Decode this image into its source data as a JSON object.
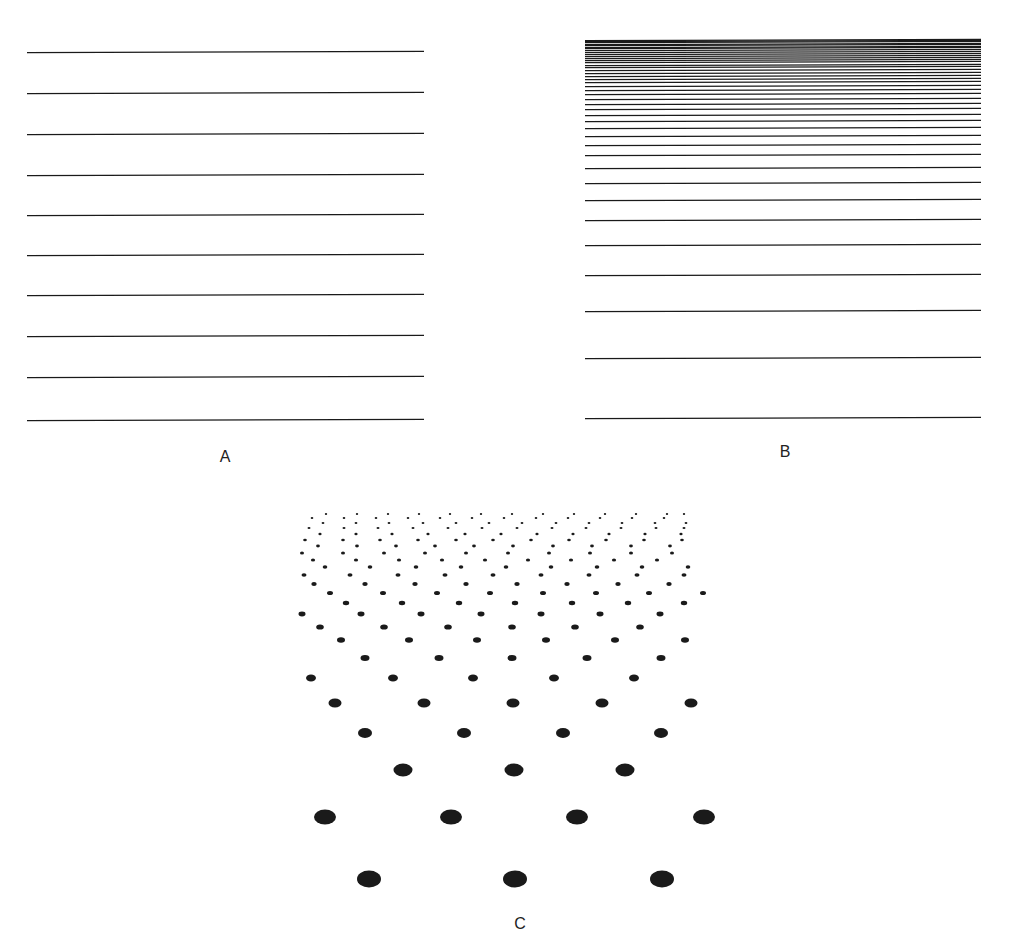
{
  "figure": {
    "background": "#ffffff",
    "ink_color": "#1a1a1a",
    "panels": [
      {
        "id": "A",
        "label": "A",
        "description": "Evenly spaced horizontal parallel lines",
        "line_count": 10,
        "x1": 27,
        "x2": 424,
        "y_lines": [
          52,
          93,
          134,
          175,
          215,
          255,
          295,
          336,
          377,
          420
        ],
        "label_pos": [
          225,
          458
        ]
      },
      {
        "id": "B",
        "label": "B",
        "description": "Horizontal lines with spacing that diminishes toward the top (texture gradient in perspective)",
        "x1": 585,
        "x2": 981,
        "y_lines": [
          418,
          358,
          311,
          275,
          245,
          220,
          200,
          183,
          168,
          155,
          145,
          136,
          128,
          121,
          115,
          109,
          104,
          99,
          94,
          90,
          86,
          82,
          79,
          76,
          73,
          70,
          67,
          65,
          62,
          60,
          58,
          56,
          54,
          52,
          50,
          48,
          47,
          45,
          44,
          42,
          41,
          40
        ],
        "label_pos": [
          785,
          453
        ]
      },
      {
        "id": "C",
        "label": "C",
        "description": "Staggered dot lattice receding in perspective; dots shrink and converge toward top",
        "label_pos": [
          520,
          925
        ],
        "rows": [
          {
            "y": 879,
            "rx": 12,
            "ry": 8.5,
            "xs": [
              369,
              515,
              662
            ]
          },
          {
            "y": 817,
            "rx": 11,
            "ry": 7.5,
            "xs": [
              325,
              451,
              577,
              704
            ]
          },
          {
            "y": 770,
            "rx": 9.5,
            "ry": 6.5,
            "xs": [
              403,
              514,
              625
            ]
          },
          {
            "y": 733,
            "rx": 7,
            "ry": 5,
            "xs": [
              365,
              464,
              563,
              661
            ]
          },
          {
            "y": 703,
            "rx": 6.5,
            "ry": 4.5,
            "xs": [
              335,
              424,
              513,
              602,
              691
            ]
          },
          {
            "y": 678,
            "rx": 5,
            "ry": 3.5,
            "xs": [
              311,
              393,
              473,
              554,
              634
            ]
          },
          {
            "y": 658,
            "rx": 4.5,
            "ry": 3,
            "xs": [
              365,
              439,
              512,
              587,
              661
            ]
          },
          {
            "y": 640,
            "rx": 4,
            "ry": 2.8,
            "xs": [
              341,
              409,
              477,
              546,
              615,
              685
            ]
          },
          {
            "y": 627,
            "rx": 3.8,
            "ry": 2.6,
            "xs": [
              320,
              384,
              448,
              512,
              575,
              640
            ]
          },
          {
            "y": 614,
            "rx": 3.5,
            "ry": 2.4,
            "xs": [
              302,
              361,
              421,
              481,
              541,
              600,
              660
            ]
          },
          {
            "y": 603,
            "rx": 3.2,
            "ry": 2.2,
            "xs": [
              346,
              402,
              459,
              515,
              572,
              628,
              684
            ]
          },
          {
            "y": 593,
            "rx": 3,
            "ry": 2,
            "xs": [
              330,
              383,
              437,
              490,
              543,
              596,
              649,
              703
            ]
          },
          {
            "y": 584,
            "rx": 2.7,
            "ry": 1.9,
            "xs": [
              314,
              365,
              415,
              466,
              517,
              567,
              618,
              669
            ]
          },
          {
            "y": 575,
            "rx": 2.5,
            "ry": 1.8,
            "xs": [
              304,
              350,
              398,
              445,
              493,
              541,
              589,
              637,
              684
            ]
          },
          {
            "y": 567,
            "rx": 2.3,
            "ry": 1.7,
            "xs": [
              325,
              370,
              416,
              461,
              506,
              551,
              597,
              642,
              688
            ]
          },
          {
            "y": 560,
            "rx": 2.1,
            "ry": 1.6,
            "xs": [
              313,
              356,
              399,
              442,
              485,
              528,
              571,
              614,
              657
            ]
          },
          {
            "y": 553,
            "rx": 2,
            "ry": 1.5,
            "xs": [
              302,
              343,
              384,
              425,
              466,
              508,
              549,
              590,
              631,
              672
            ]
          },
          {
            "y": 546,
            "rx": 1.9,
            "ry": 1.4,
            "xs": [
              318,
              357,
              396,
              435,
              474,
              513,
              553,
              592,
              631,
              670
            ]
          },
          {
            "y": 540,
            "rx": 1.8,
            "ry": 1.3,
            "xs": [
              305,
              343,
              380,
              418,
              456,
              493,
              531,
              569,
              606,
              644,
              682
            ]
          },
          {
            "y": 534,
            "rx": 1.6,
            "ry": 1.2,
            "xs": [
              320,
              356,
              392,
              428,
              465,
              501,
              537,
              573,
              609,
              645,
              681
            ]
          },
          {
            "y": 528,
            "rx": 1.5,
            "ry": 1.1,
            "xs": [
              309,
              344,
              378,
              413,
              448,
              482,
              517,
              552,
              586,
              621,
              656,
              684
            ]
          },
          {
            "y": 523,
            "rx": 1.4,
            "ry": 1,
            "xs": [
              323,
              356,
              389,
              423,
              456,
              489,
              522,
              556,
              589,
              622,
              655,
              686
            ]
          },
          {
            "y": 518,
            "rx": 1.3,
            "ry": 0.9,
            "xs": [
              312,
              344,
              376,
              408,
              440,
              472,
              504,
              536,
              568,
              600,
              632,
              664
            ]
          },
          {
            "y": 514,
            "rx": 1.2,
            "ry": 0.9,
            "xs": [
              326,
              357,
              388,
              419,
              450,
              481,
              512,
              543,
              574,
              605,
              636,
              667,
              684
            ]
          }
        ]
      }
    ]
  }
}
